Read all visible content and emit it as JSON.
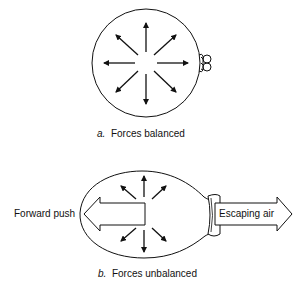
{
  "diagram": {
    "panel_a": {
      "letter": "a.",
      "caption": "Forces balanced"
    },
    "panel_b": {
      "letter": "b.",
      "caption": "Forces unbalanced",
      "left_arrow_label": "Forward push",
      "right_arrow_label": "Escaping air"
    },
    "colors": {
      "stroke": "#111111",
      "background": "#ffffff"
    }
  }
}
